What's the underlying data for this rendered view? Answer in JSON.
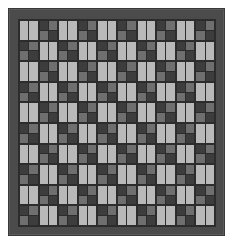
{
  "quilt": {
    "columns": 10,
    "rows": 10,
    "colors": {
      "border": "#4b4b4b",
      "grid_line": "#2c2c2c",
      "light_stripe": "#b9b9b9",
      "dark_square": "#3d3d3d",
      "mid_square": "#6f6f6f",
      "background": "#ffffff"
    },
    "cell_types": [
      "light-pair",
      "checker-2x2"
    ],
    "pattern": "alternating checkerboard of light stripe-pairs and dark/mid 2x2 checkers; row 1 starts with light-pair"
  }
}
